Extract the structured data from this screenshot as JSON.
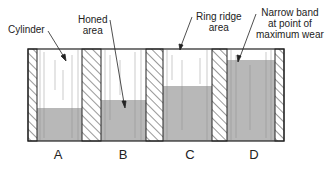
{
  "figure": {
    "callouts": [
      {
        "id": "cylinder",
        "lines": [
          "Cylinder"
        ]
      },
      {
        "id": "honed",
        "lines": [
          "Honed",
          "area"
        ]
      },
      {
        "id": "ringridge",
        "lines": [
          "Ring ridge",
          "area"
        ]
      },
      {
        "id": "narrowband",
        "lines": [
          "Narrow band",
          "at point of",
          "maximum wear"
        ]
      }
    ],
    "panels": [
      {
        "letter": "A",
        "shaded_fraction": 0.36
      },
      {
        "letter": "B",
        "shaded_fraction": 0.45
      },
      {
        "letter": "C",
        "shaded_fraction": 0.6
      },
      {
        "letter": "D",
        "shaded_fraction": 0.88
      }
    ],
    "colors": {
      "outline": "#222222",
      "shaded": "#b8b8b8",
      "bore_white": "#ffffff",
      "hatch": "#333333"
    }
  }
}
